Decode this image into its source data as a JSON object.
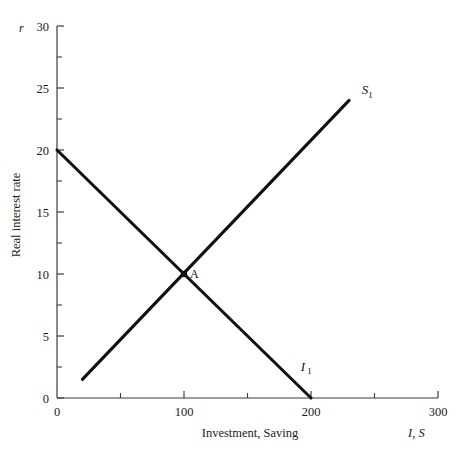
{
  "figure": {
    "background_color": "#ffffff",
    "ink_color": "#111111",
    "axis_color": "#3c3c3c"
  },
  "chart_data": {
    "type": "line",
    "title": "",
    "xlabel": "Investment, Saving",
    "ylabel": "Real interest rate",
    "x_symbol": "I, S",
    "y_symbol": "r",
    "xlim": [
      0,
      300
    ],
    "ylim": [
      0,
      30
    ],
    "grid": false,
    "legend": "none",
    "x_ticks": [
      0,
      100,
      200,
      300
    ],
    "x_tick_labels": [
      "0",
      "100",
      "200",
      "300"
    ],
    "x_minor_ticks": [
      50,
      150,
      250
    ],
    "y_ticks": [
      0,
      5,
      10,
      15,
      20,
      25,
      30
    ],
    "y_tick_labels": [
      "0",
      "5",
      "10",
      "15",
      "20",
      "25",
      "30"
    ],
    "y_minor_ticks": [
      2.5,
      7.5,
      12.5,
      17.5,
      22.5,
      27.5
    ],
    "series": [
      {
        "name": "S1",
        "label": "S",
        "label_sub": "1",
        "description": "Saving schedule, upward sloping",
        "x": [
          20,
          230
        ],
        "y": [
          1.5,
          24.0
        ],
        "label_x": 240,
        "label_y": 24.5
      },
      {
        "name": "I1",
        "label": "I",
        "label_sub": "1",
        "description": "Investment schedule, downward sloping",
        "x": [
          0,
          200
        ],
        "y": [
          20.0,
          0.0
        ],
        "label_x": 192,
        "label_y": 2.2
      }
    ],
    "annotations": [
      {
        "name": "A",
        "label": "A",
        "x": 100,
        "y": 10,
        "description": "Equilibrium point where saving equals investment"
      }
    ]
  }
}
